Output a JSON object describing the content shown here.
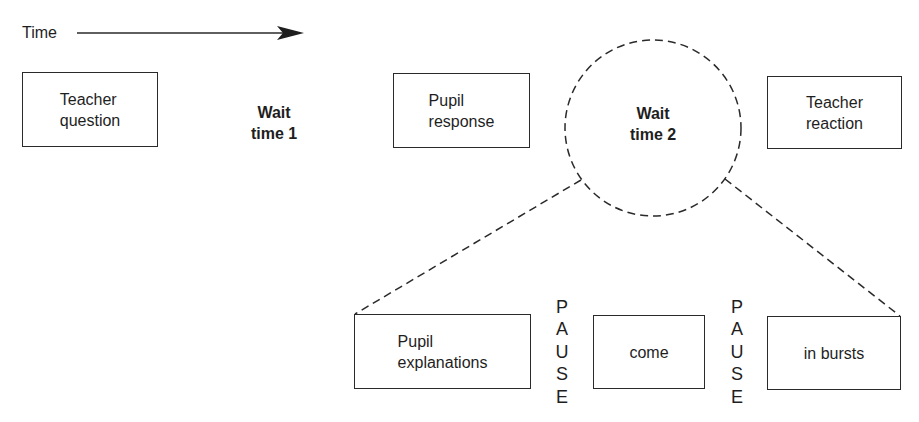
{
  "time_axis": {
    "label": "Time",
    "direction": "left-to-right"
  },
  "top_row": {
    "teacher_question": "Teacher\nquestion",
    "wait_time_1": "Wait\ntime 1",
    "pupil_response": "Pupil\nresponse",
    "wait_time_2": "Wait\ntime 2",
    "teacher_reaction": "Teacher\nreaction"
  },
  "expansion": {
    "boxes": [
      {
        "label": "Pupil\nexplanations"
      },
      {
        "label": "come"
      },
      {
        "label": "in bursts"
      }
    ],
    "pauses": [
      {
        "letters": [
          "P",
          "A",
          "U",
          "S",
          "E"
        ]
      },
      {
        "letters": [
          "P",
          "A",
          "U",
          "S",
          "E"
        ]
      }
    ]
  },
  "colors": {
    "stroke": "#2a2a2a",
    "text": "#1e1e1e",
    "background": "#ffffff"
  }
}
